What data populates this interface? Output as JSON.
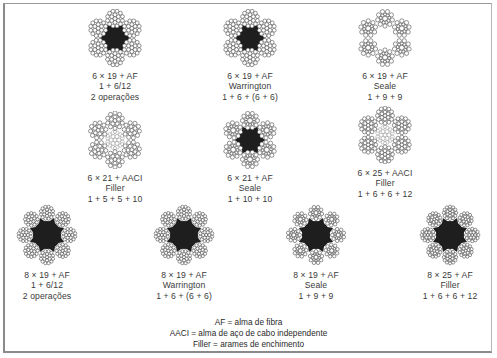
{
  "figure": {
    "ropes": [
      {
        "id": "r1",
        "cx": 115,
        "cy": 38,
        "strands": 6,
        "core": "fiber",
        "pattern": "6-12",
        "lines": [
          "6 × 19 + AF",
          "1 + 6/12",
          "2 operações"
        ]
      },
      {
        "id": "r2",
        "cx": 250,
        "cy": 38,
        "strands": 6,
        "core": "fiber",
        "pattern": "6-6-6",
        "lines": [
          "6 × 19 + AF",
          "Warrington",
          "1 + 6 + (6 + 6)"
        ]
      },
      {
        "id": "r3",
        "cx": 385,
        "cy": 38,
        "strands": 6,
        "core": "none",
        "pattern": "9-9",
        "lines": [
          "6 × 19 + AF",
          "Seale",
          "1 + 9 + 9"
        ]
      },
      {
        "id": "r4",
        "cx": 115,
        "cy": 140,
        "strands": 6,
        "core": "steel",
        "pattern": "5-5-10",
        "lines": [
          "6 × 21 + AACI",
          "Filler",
          "1 + 5 + 5 + 10"
        ]
      },
      {
        "id": "r5",
        "cx": 250,
        "cy": 140,
        "strands": 6,
        "core": "fiber",
        "pattern": "10-10",
        "lines": [
          "6 × 21 + AF",
          "Seale",
          "1 + 10 + 10"
        ]
      },
      {
        "id": "r6",
        "cx": 385,
        "cy": 135,
        "strands": 6,
        "core": "steel",
        "pattern": "6-6-12",
        "lines": [
          "6 × 25 + AACI",
          "Filler",
          "1 + 6 + 6 + 12"
        ]
      },
      {
        "id": "r7",
        "cx": 47,
        "cy": 235,
        "strands": 8,
        "core": "fiber",
        "pattern": "6-12",
        "lines": [
          "8 × 19 + AF",
          "1 + 6/12",
          "2 operações"
        ]
      },
      {
        "id": "r8",
        "cx": 184,
        "cy": 235,
        "strands": 8,
        "core": "fiber",
        "pattern": "6-6-6",
        "lines": [
          "8 × 19 + AF",
          "Warrington",
          "1 + 6 + (6 + 6)"
        ]
      },
      {
        "id": "r9",
        "cx": 316,
        "cy": 235,
        "strands": 8,
        "core": "fiber",
        "pattern": "9-9",
        "lines": [
          "8 × 19 + AF",
          "Seale",
          "1 + 9 + 9"
        ]
      },
      {
        "id": "r10",
        "cx": 450,
        "cy": 235,
        "strands": 8,
        "core": "fiber",
        "pattern": "6-6-12",
        "lines": [
          "8 × 25 + AF",
          "Filler",
          "1 + 6 + 6 + 12"
        ]
      }
    ],
    "legend": [
      "AF = alma de fibra",
      "AACI = alma de aço de cabo independente",
      "Filler = arames de enchimento"
    ],
    "colors": {
      "wire_stroke": "#2b2b2b",
      "core_fill": "#1e1e1e",
      "text": "#3a3a3a",
      "frame": "#8a8a8a"
    }
  }
}
